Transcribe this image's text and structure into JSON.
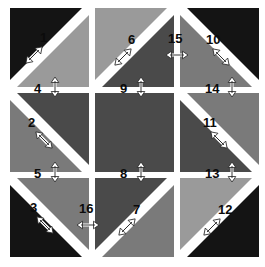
{
  "figure": {
    "title": "",
    "canvas": {
      "width": 265,
      "height": 267,
      "background": "#ffffff"
    },
    "grid": {
      "rows": 3,
      "cols": 3,
      "cell_size": 79,
      "gap": 14
    },
    "palette": {
      "black": "#141414",
      "dark_gray": "#4a4a4a",
      "mid_gray": "#6e6e6e",
      "light_gray": "#9a9a9a",
      "white": "#ffffff",
      "outline": "#000000"
    }
  },
  "cells": [
    {
      "id": "cell-r1c1",
      "row": 1,
      "col": 1,
      "upper_left": {
        "shade": "black",
        "color": "#141414"
      },
      "lower_right": {
        "shade": "light_gray",
        "color": "#9a9a9a"
      },
      "split": "tl-br"
    },
    {
      "id": "cell-r1c2",
      "row": 1,
      "col": 2,
      "upper_left": {
        "shade": "light_gray",
        "color": "#9a9a9a"
      },
      "lower_right": {
        "shade": "dark_gray",
        "color": "#4a4a4a"
      },
      "split": "tl-br"
    },
    {
      "id": "cell-r1c3",
      "row": 1,
      "col": 3,
      "upper_left": {
        "shade": "black",
        "color": "#141414"
      },
      "lower_right": {
        "shade": "mid_gray",
        "color": "#7a7a7a"
      },
      "split": "tr-bl"
    },
    {
      "id": "cell-r2c1",
      "row": 2,
      "col": 1,
      "upper_left": {
        "shade": "dark_gray",
        "color": "#4a4a4a"
      },
      "lower_right": {
        "shade": "mid_gray",
        "color": "#7a7a7a"
      },
      "split": "tr-bl"
    },
    {
      "id": "cell-r2c2",
      "row": 2,
      "col": 2,
      "upper_left": {
        "shade": "dark_gray",
        "color": "#4a4a4a"
      },
      "lower_right": {
        "shade": "dark_gray",
        "color": "#4a4a4a"
      },
      "split": "none"
    },
    {
      "id": "cell-r2c3",
      "row": 2,
      "col": 3,
      "upper_left": {
        "shade": "mid_gray",
        "color": "#7a7a7a"
      },
      "lower_right": {
        "shade": "dark_gray",
        "color": "#4a4a4a"
      },
      "split": "tr-bl"
    },
    {
      "id": "cell-r3c1",
      "row": 3,
      "col": 1,
      "upper_left": {
        "shade": "mid_gray",
        "color": "#7a7a7a"
      },
      "lower_right": {
        "shade": "black",
        "color": "#141414"
      },
      "split": "tr-bl"
    },
    {
      "id": "cell-r3c2",
      "row": 3,
      "col": 2,
      "upper_left": {
        "shade": "dark_gray",
        "color": "#4a4a4a"
      },
      "lower_right": {
        "shade": "mid_gray",
        "color": "#7a7a7a"
      },
      "split": "tl-br"
    },
    {
      "id": "cell-r3c3",
      "row": 3,
      "col": 3,
      "upper_left": {
        "shade": "light_gray",
        "color": "#9a9a9a"
      },
      "lower_right": {
        "shade": "black",
        "color": "#141414"
      },
      "split": "tl-br"
    }
  ],
  "arrows": [
    {
      "id": 1,
      "label": "1",
      "orientation": "diagonal-ne-sw",
      "cell": "cell-r1c1"
    },
    {
      "id": 2,
      "label": "2",
      "orientation": "diagonal-nw-se",
      "cell": "cell-r2c1"
    },
    {
      "id": 3,
      "label": "3",
      "orientation": "diagonal-nw-se",
      "cell": "cell-r3c1"
    },
    {
      "id": 4,
      "label": "4",
      "orientation": "vertical",
      "between": "cell-r1c1/cell-r2c1"
    },
    {
      "id": 5,
      "label": "5",
      "orientation": "vertical",
      "between": "cell-r2c1/cell-r3c1"
    },
    {
      "id": 6,
      "label": "6",
      "orientation": "diagonal-ne-sw",
      "cell": "cell-r1c2"
    },
    {
      "id": 7,
      "label": "7",
      "orientation": "diagonal-ne-sw",
      "cell": "cell-r3c2"
    },
    {
      "id": 8,
      "label": "8",
      "orientation": "vertical",
      "between": "cell-r2c2/cell-r3c2"
    },
    {
      "id": 9,
      "label": "9",
      "orientation": "vertical",
      "between": "cell-r1c2/cell-r2c2"
    },
    {
      "id": 10,
      "label": "10",
      "orientation": "diagonal-nw-se",
      "cell": "cell-r1c3"
    },
    {
      "id": 11,
      "label": "11",
      "orientation": "diagonal-nw-se",
      "cell": "cell-r2c3"
    },
    {
      "id": 12,
      "label": "12",
      "orientation": "diagonal-ne-sw",
      "cell": "cell-r3c3"
    },
    {
      "id": 13,
      "label": "13",
      "orientation": "vertical",
      "between": "cell-r2c3/cell-r3c3"
    },
    {
      "id": 14,
      "label": "14",
      "orientation": "vertical",
      "between": "cell-r1c3/cell-r2c3"
    },
    {
      "id": 15,
      "label": "15",
      "orientation": "horizontal",
      "between": "cell-r1c2/cell-r1c3"
    },
    {
      "id": 16,
      "label": "16",
      "orientation": "horizontal",
      "between": "cell-r3c1/cell-r3c2"
    }
  ]
}
